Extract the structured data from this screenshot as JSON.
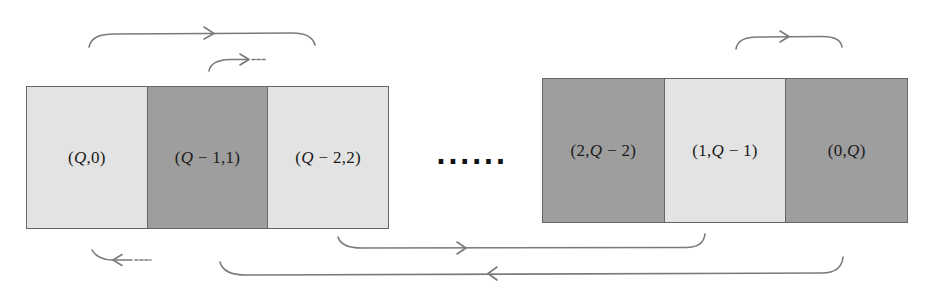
{
  "diagram": {
    "type": "cyclic-state-sequence",
    "left_group": {
      "cells": [
        {
          "label_prefix": "(",
          "label_var1": "Q",
          "label_rest": ",0)",
          "full": "(Q,0)",
          "shade": "light"
        },
        {
          "label_prefix": "(",
          "label_var1": "Q",
          "label_rest": " − 1,1)",
          "full": "(Q − 1,1)",
          "shade": "dark"
        },
        {
          "label_prefix": "(",
          "label_var1": "Q",
          "label_rest": " − 2,2)",
          "full": "(Q − 2,2)",
          "shade": "light"
        }
      ]
    },
    "ellipsis": "......",
    "right_group": {
      "cells": [
        {
          "label_prefix": "(2,",
          "label_var1": "Q",
          "label_rest": " − 2)",
          "full": "(2,Q − 2)",
          "shade": "dark"
        },
        {
          "label_prefix": "(1,",
          "label_var1": "Q",
          "label_rest": " − 1)",
          "full": "(1,Q − 1)",
          "shade": "light"
        },
        {
          "label_prefix": "(0,",
          "label_var1": "Q",
          "label_rest": ")",
          "full": "(0,Q)",
          "shade": "dark"
        }
      ]
    },
    "arrows": [
      {
        "id": "top-left-long",
        "from": "(Q,0)",
        "to": "(Q-2,2)",
        "direction": "right",
        "style": "solid"
      },
      {
        "id": "top-left-short",
        "from": "(Q-1,1)",
        "to": "continues",
        "direction": "right",
        "style": "solid-dashed-tail"
      },
      {
        "id": "top-right",
        "from": "(1,Q-1)",
        "to": "(0,Q)",
        "direction": "right",
        "style": "solid"
      },
      {
        "id": "bottom-left-short",
        "from": "incoming",
        "to": "(Q,0)",
        "direction": "left",
        "style": "solid-dashed-tail"
      },
      {
        "id": "bottom-mid",
        "from": "(Q-2,2)",
        "to": "(1,Q-1)",
        "direction": "right",
        "style": "solid"
      },
      {
        "id": "bottom-long",
        "from": "(0,Q)",
        "to": "(Q-1,1)",
        "direction": "left",
        "style": "solid"
      }
    ],
    "colors": {
      "light_cell": "#e3e3e3",
      "dark_cell": "#9e9e9e",
      "border": "#666666",
      "arrow": "#7a7a7a",
      "text": "#1a1a1a"
    }
  }
}
